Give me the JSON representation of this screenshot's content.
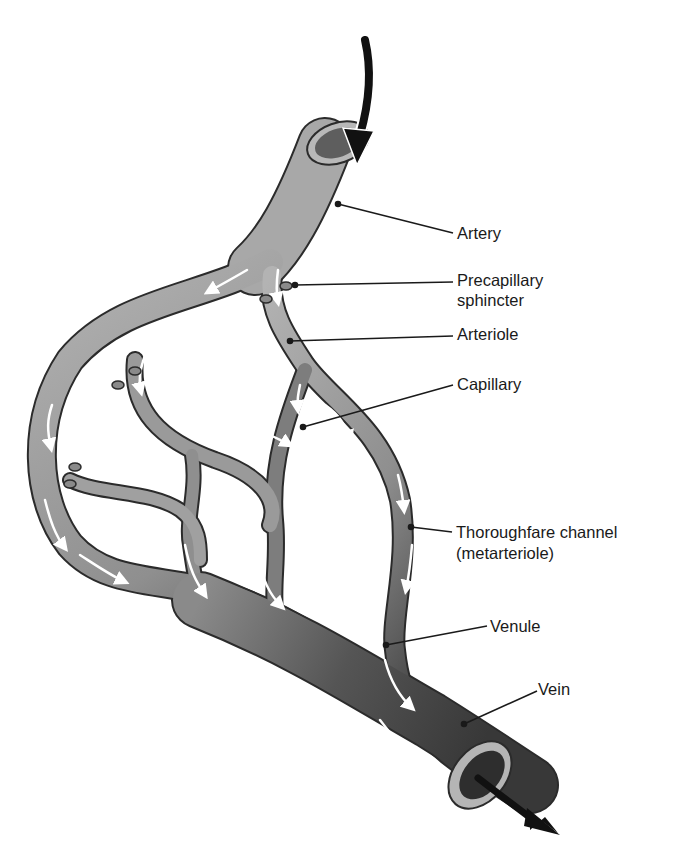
{
  "diagram": {
    "colors": {
      "background": "#ffffff",
      "artery": "#a9a9a9",
      "vein": "#4a4a4a",
      "outline": "#2b2b2b",
      "flow_arrow": "#ffffff",
      "leader_line": "#1a1a1a",
      "label_text": "#1a1a1a"
    },
    "labels": {
      "artery": "Artery",
      "precapillary_line1": "Precapillary",
      "precapillary_line2": "sphincter",
      "arteriole": "Arteriole",
      "capillary": "Capillary",
      "thoroughfare_line1": "Thoroughfare channel",
      "thoroughfare_line2": "(metarteriole)",
      "venule": "Venule",
      "vein": "Vein"
    },
    "flow": {
      "inflow": "blood-in-arrow",
      "outflow": "blood-out-arrow"
    }
  }
}
